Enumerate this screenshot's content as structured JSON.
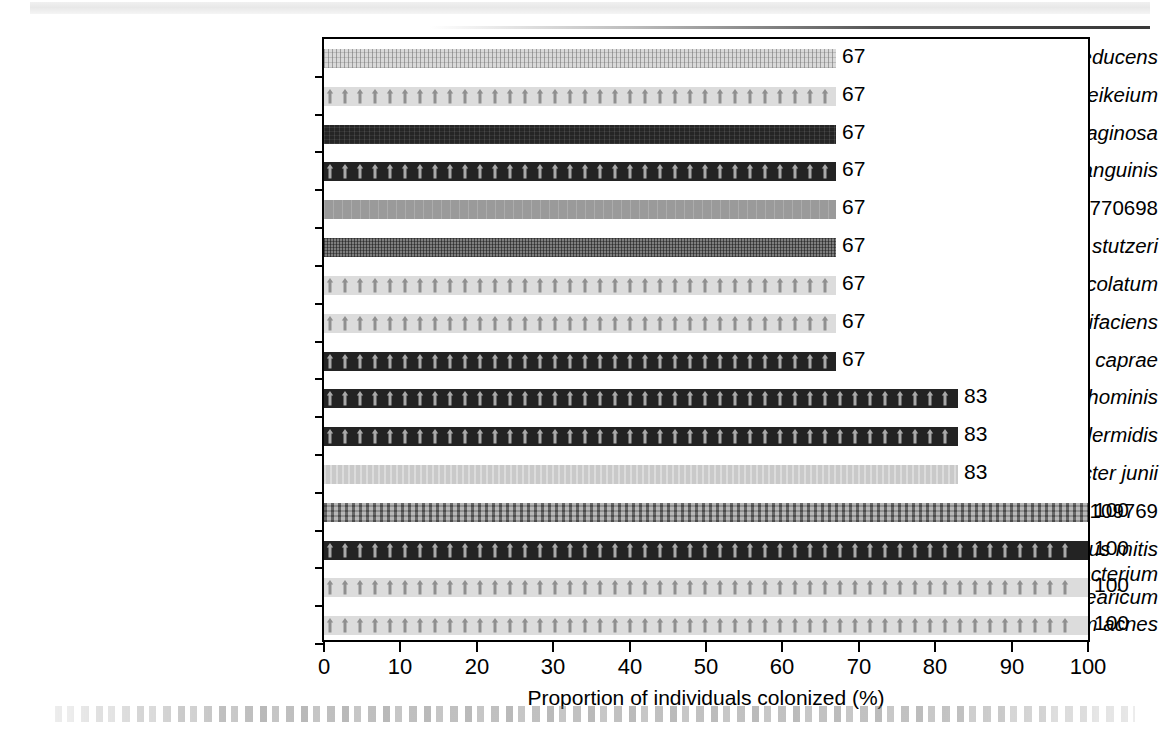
{
  "figure": {
    "axis_title": "Proportion of individuals colonized (%)"
  },
  "chart_data": {
    "type": "bar",
    "orientation": "horizontal",
    "title": "",
    "xlabel": "Proportion of individuals colonized (%)",
    "ylabel": "",
    "xlim": [
      0,
      100
    ],
    "xticks": [
      0,
      10,
      20,
      30,
      40,
      50,
      60,
      70,
      80,
      90,
      100
    ],
    "grid": false,
    "legend": false,
    "categories": [
      "Diaphorobacter nitroreducens",
      "Corynebacterium jeikeium",
      "Rothia mucilaginosa",
      "Streptococcus sanguinis",
      "Actinomycetales AY770698",
      "Pseudomonas stutzeri",
      "Corynebacterium amycolatum",
      "Corynebacterium mucifaciens",
      "Staphylococcus caprae",
      "Staphylococcus hominis",
      "Staphylococcus epidermidis",
      "Acinetobacter junii",
      "Finegoldia AB109769",
      "Streptococcus mitis",
      "Corynebacterium tuberculostearicum",
      "Propionibacterium acnes"
    ],
    "values": [
      67,
      67,
      67,
      67,
      67,
      67,
      67,
      67,
      67,
      83,
      83,
      83,
      100,
      100,
      100,
      100
    ],
    "value_labels": [
      "67",
      "67",
      "67",
      "67",
      "67",
      "67",
      "67",
      "67",
      "67",
      "83",
      "83",
      "83",
      "100",
      "100",
      "100",
      "100"
    ]
  },
  "bars": [
    {
      "label_italic": "Diaphorobacter nitroreducens",
      "label_upright": "",
      "value": 67,
      "value_label": "67",
      "pattern": "vertical-fine-hatch-light",
      "fill": "#d9d9d9"
    },
    {
      "label_italic": "Corynebacterium jeikeium",
      "label_upright": "",
      "value": 67,
      "value_label": "67",
      "pattern": "arrow-motif-light",
      "fill": "#dcdcdc"
    },
    {
      "label_italic": "Rothia mucilaginosa",
      "label_upright": "",
      "value": 67,
      "value_label": "67",
      "pattern": "solid-dark",
      "fill": "#252525"
    },
    {
      "label_italic": "Streptococcus sanguinis",
      "label_upright": "",
      "value": 67,
      "value_label": "67",
      "pattern": "arrow-motif-dark",
      "fill": "#232323"
    },
    {
      "label_italic": "Actinomycetales",
      "label_upright": "AY770698",
      "value": 67,
      "value_label": "67",
      "pattern": "mid-grey-plain",
      "fill": "#9a9a9a"
    },
    {
      "label_italic": "Pseudomonas stutzeri",
      "label_upright": "",
      "value": 67,
      "value_label": "67",
      "pattern": "mid-grey-grid",
      "fill": "#7e7e7e"
    },
    {
      "label_italic": "Corynebacterium amycolatum",
      "label_upright": "",
      "value": 67,
      "value_label": "67",
      "pattern": "arrow-motif-light",
      "fill": "#dcdcdc"
    },
    {
      "label_italic": "Corynebacterium mucifaciens",
      "label_upright": "",
      "value": 67,
      "value_label": "67",
      "pattern": "arrow-motif-light",
      "fill": "#dcdcdc"
    },
    {
      "label_italic": "Staphylococcus caprae",
      "label_upright": "",
      "value": 67,
      "value_label": "67",
      "pattern": "arrow-motif-dark",
      "fill": "#232323"
    },
    {
      "label_italic": "Staphylococcus hominis",
      "label_upright": "",
      "value": 83,
      "value_label": "83",
      "pattern": "arrow-motif-dark",
      "fill": "#232323"
    },
    {
      "label_italic": "Staphylococcus epidermidis",
      "label_upright": "",
      "value": 83,
      "value_label": "83",
      "pattern": "arrow-motif-dark",
      "fill": "#232323"
    },
    {
      "label_italic": "Acinetobacter junii",
      "label_upright": "",
      "value": 83,
      "value_label": "83",
      "pattern": "light-grey-plain",
      "fill": "#c9c9c9"
    },
    {
      "label_italic": "Finegoldia",
      "label_upright": "AB109769",
      "value": 100,
      "value_label": "100",
      "pattern": "mid-grey-check",
      "fill": "#8a8a8a"
    },
    {
      "label_italic": "Streptococcus mitis",
      "label_upright": "",
      "value": 100,
      "value_label": "100",
      "pattern": "arrow-motif-dark",
      "fill": "#232323"
    },
    {
      "label_italic": "Corynebacterium tuberculostearicum",
      "label_upright": "",
      "value": 100,
      "value_label": "100",
      "pattern": "arrow-motif-light",
      "fill": "#dcdcdc"
    },
    {
      "label_italic": "Propionibacterium acnes",
      "label_upright": "",
      "value": 100,
      "value_label": "100",
      "pattern": "arrow-motif-light",
      "fill": "#dcdcdc"
    }
  ],
  "xaxis": {
    "ticks": [
      "0",
      "10",
      "20",
      "30",
      "40",
      "50",
      "60",
      "70",
      "80",
      "90",
      "100"
    ]
  }
}
